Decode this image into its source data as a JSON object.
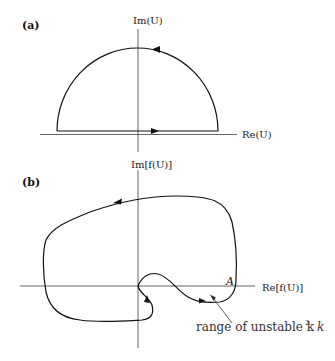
{
  "panel_a": {
    "label": "(a)",
    "y_axis_label": "Im(U)",
    "x_axis_label": "Re(U)",
    "contour": "semicircle in upper half-plane, traversed counter-clockwise"
  },
  "panel_b": {
    "label": "(b)",
    "y_axis_label": "Im[f(U)]",
    "x_axis_label": "Re[f(U)]",
    "point_label": "A",
    "annotation": "range of unstable k",
    "annotation_superscript": "2"
  },
  "colors": {
    "curve": "#111111",
    "axis": "#555555",
    "background": "#ffffff"
  }
}
